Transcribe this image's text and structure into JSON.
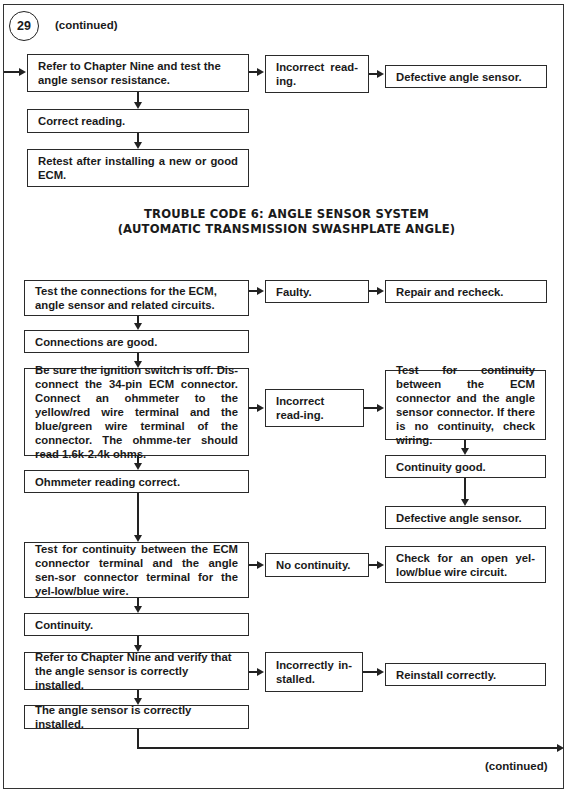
{
  "header": {
    "figure_number": "29",
    "continued_label": "(continued)"
  },
  "section1": {
    "test_resistance": "Refer to Chapter Nine and test the angle sensor resistance.",
    "incorrect_reading": "Incorrect read-ing.",
    "defective_sensor": "Defective angle sensor.",
    "correct_reading": "Correct reading.",
    "retest": "Retest after installing a new or good ECM."
  },
  "title": {
    "line1": "TROUBLE CODE 6: ANGLE SENSOR SYSTEM",
    "line2": "(AUTOMATIC TRANSMISSION SWASHPLATE ANGLE)"
  },
  "section2": {
    "test_connections": "Test the connections for the ECM, angle sensor and related circuits.",
    "faulty": "Faulty.",
    "repair": "Repair and recheck.",
    "connections_good": "Connections are good.",
    "ohmmeter_test": "Be sure the ignition switch is off. Dis-connect the 34-pin ECM connector. Connect an ohmmeter to the yellow/red wire terminal and the blue/green wire terminal of the connector. The ohmme-ter should read 1.6k-2.4k ohms.",
    "incorrect_reading": "Incorrect read-ing.",
    "continuity_test_wiring": "Test for continuity between the ECM connector and the angle sensor connector. If there is no continuity, check wiring.",
    "continuity_good": "Continuity good.",
    "defective_sensor": "Defective angle sensor.",
    "ohmmeter_correct": "Ohmmeter reading correct.",
    "continuity_test_wire": "Test for continuity between the ECM connector terminal and the angle sen-sor connector terminal for the yel-low/blue wire.",
    "no_continuity": "No continuity.",
    "check_open": "Check for an open yel-low/blue wire circuit.",
    "continuity": "Continuity.",
    "verify_install": "Refer to Chapter Nine and verify that the angle sensor is correctly installed.",
    "incorrectly_installed": "Incorrectly in-stalled.",
    "reinstall": "Reinstall correctly.",
    "correctly_installed": "The angle sensor is correctly installed."
  },
  "footer": {
    "continued_label": "(continued)"
  }
}
